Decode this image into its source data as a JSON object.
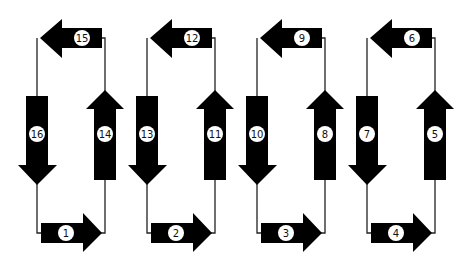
{
  "diagram": {
    "colors": {
      "arrow": "#000000",
      "line": "#222222",
      "badge": "#ffffff",
      "background": "#ffffff"
    },
    "column_spacing": 110,
    "columns": [
      {
        "top_left_arrow": "15",
        "down_arrow": "16",
        "up_arrow": "14",
        "bottom_right_arrow": "1"
      },
      {
        "top_left_arrow": "12",
        "down_arrow": "13",
        "up_arrow": "11",
        "bottom_right_arrow": "2"
      },
      {
        "top_left_arrow": "9",
        "down_arrow": "10",
        "up_arrow": "8",
        "bottom_right_arrow": "3"
      },
      {
        "top_left_arrow": "6",
        "down_arrow": "7",
        "up_arrow": "5",
        "bottom_right_arrow": "4"
      }
    ]
  }
}
